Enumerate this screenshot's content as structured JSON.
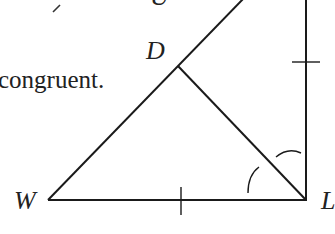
{
  "caption": "congruent.",
  "labels": {
    "top_partial": "U",
    "D": "D",
    "W": "W",
    "L": "L"
  },
  "geometry": {
    "stroke_color": "#1a1a1a",
    "points": {
      "W": [
        48,
        200
      ],
      "L": [
        306,
        200
      ],
      "D": [
        178,
        66
      ],
      "top_left_end": [
        244,
        -2
      ],
      "vertical_top": [
        306,
        -2
      ]
    },
    "tick_marks": [
      "WL",
      "L-vertical"
    ],
    "angle_marks": [
      "angle WLD",
      "angle DL-vertical"
    ]
  }
}
